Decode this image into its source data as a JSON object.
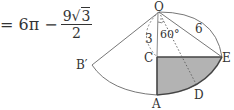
{
  "formula": {
    "lhs": "= 6π −",
    "numerator_coef": "9",
    "numerator_radical": "√",
    "numerator_radicand": "3",
    "denominator": "2"
  },
  "diagram": {
    "labels": {
      "O": "O",
      "A": "A",
      "B_prime": "B′",
      "C": "C",
      "D": "D",
      "E": "E",
      "len_OC": "3",
      "len_OE": "6",
      "angle": "60°"
    },
    "colors": {
      "stroke": "#444444",
      "shade": "#b3b3b3"
    }
  }
}
